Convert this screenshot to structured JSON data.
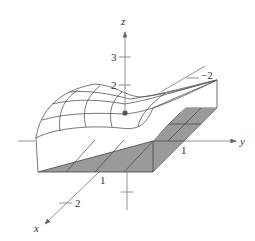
{
  "figure": {
    "type": "3d-surface-wireframe",
    "colors": {
      "background": "#ffffff",
      "line": "#555555",
      "axis": "#666666",
      "region_fill": "#9a9a9a",
      "point": "#555555"
    },
    "axes": {
      "x": {
        "label": "x",
        "ticks": [
          {
            "label": "1"
          },
          {
            "label": "2"
          },
          {
            "label": "−2"
          }
        ]
      },
      "y": {
        "label": "y",
        "ticks": [
          {
            "label": "1"
          }
        ]
      },
      "z": {
        "label": "z",
        "ticks": [
          {
            "label": "2"
          },
          {
            "label": "3"
          }
        ]
      }
    },
    "marked_point": "point on surface above origin"
  }
}
